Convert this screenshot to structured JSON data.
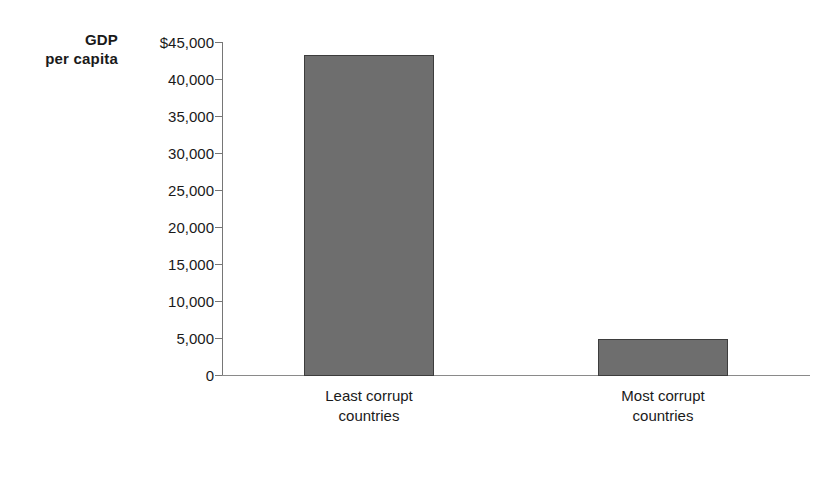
{
  "chart_data": {
    "type": "bar",
    "title": "",
    "subtitle": "",
    "xlabel": "",
    "ylabel": "GDP\nper capita",
    "ylabel_line1": "GDP",
    "ylabel_line2": "per capita",
    "categories": [
      "Least corrupt\ncountries",
      "Most corrupt\ncountries"
    ],
    "category_labels": [
      {
        "line1": "Least corrupt",
        "line2": "countries",
        "full": "Least corrupt countries"
      },
      {
        "line1": "Most corrupt",
        "line2": "countries",
        "full": "Most corrupt countries"
      }
    ],
    "values": [
      43200,
      4900
    ],
    "ylim": [
      0,
      45000
    ],
    "ytick_step": 5000,
    "ytick_values": [
      45000,
      40000,
      35000,
      30000,
      25000,
      20000,
      15000,
      10000,
      5000,
      0
    ],
    "ytick_labels": [
      "$45,000",
      "40,000",
      "35,000",
      "30,000",
      "25,000",
      "20,000",
      "15,000",
      "10,000",
      "5,000",
      "0"
    ],
    "grid": false,
    "legend": false,
    "legend_position": "none",
    "annotations": [],
    "bar_color": "#6e6e6e",
    "bar_border_color": "#3d3d3d",
    "axis_color": "#767676",
    "text_color": "#1a1a1a",
    "background_color": "#ffffff"
  }
}
